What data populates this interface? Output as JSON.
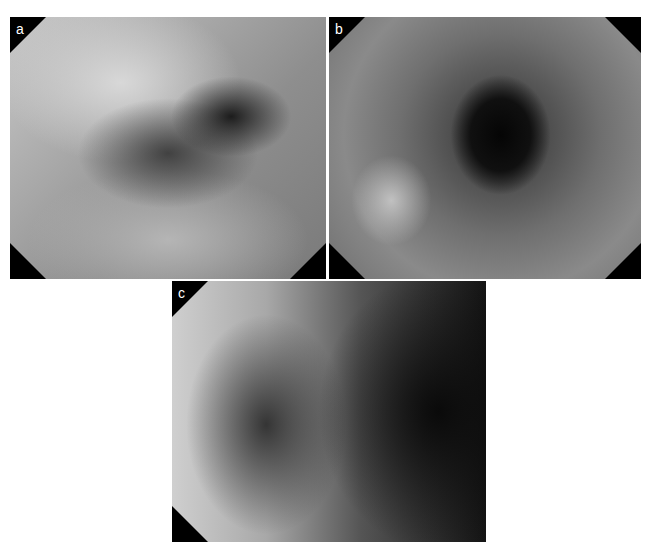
{
  "figure": {
    "panels": [
      {
        "label": "a",
        "description": "Endoscopic white-light view showing irregular dark mucosal lesion near lumen"
      },
      {
        "label": "b",
        "description": "Endoscopic view with enhanced texture showing dark lumen and lesion at left"
      },
      {
        "label": "c",
        "description": "Endoscopic view showing dark irregular lesion area"
      }
    ]
  }
}
